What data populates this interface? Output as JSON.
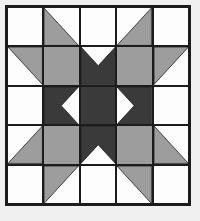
{
  "artwork": {
    "title": "Patchwork Quilt Block",
    "pattern_name": "Eight-Pointed Star Quilt Block",
    "grid_rows": 5,
    "grid_columns": 5,
    "background_color": "#f0f0f0",
    "frame_color": "#1c1c1c",
    "seam_line_color": "#1c1c1c",
    "palette": {
      "light": "#fdfdfd",
      "medium": "#9d9d9d",
      "dark": "#3a3a3a"
    },
    "cells": [
      [
        {
          "name": "r1c1",
          "fill": "light",
          "shape": "solid"
        },
        {
          "name": "r1c2",
          "fill": "medium",
          "shape": "triangle-bottom-left",
          "base": "light"
        },
        {
          "name": "r1c3",
          "fill": "light",
          "shape": "solid"
        },
        {
          "name": "r1c4",
          "fill": "medium",
          "shape": "triangle-bottom-right",
          "base": "light"
        },
        {
          "name": "r1c5",
          "fill": "light",
          "shape": "solid"
        }
      ],
      [
        {
          "name": "r2c1",
          "fill": "medium",
          "shape": "triangle-top-right",
          "base": "light"
        },
        {
          "name": "r2c2",
          "fill": "medium",
          "shape": "solid"
        },
        {
          "name": "r2c3",
          "fill": "dark",
          "shape": "notch-down",
          "base": "light"
        },
        {
          "name": "r2c4",
          "fill": "medium",
          "shape": "solid"
        },
        {
          "name": "r2c5",
          "fill": "medium",
          "shape": "triangle-top-left",
          "base": "light"
        }
      ],
      [
        {
          "name": "r3c1",
          "fill": "light",
          "shape": "solid"
        },
        {
          "name": "r3c2",
          "fill": "dark",
          "shape": "notch-right",
          "base": "light"
        },
        {
          "name": "r3c3",
          "fill": "dark",
          "shape": "solid"
        },
        {
          "name": "r3c4",
          "fill": "dark",
          "shape": "notch-left",
          "base": "light"
        },
        {
          "name": "r3c5",
          "fill": "light",
          "shape": "solid"
        }
      ],
      [
        {
          "name": "r4c1",
          "fill": "medium",
          "shape": "triangle-bottom-right",
          "base": "light"
        },
        {
          "name": "r4c2",
          "fill": "medium",
          "shape": "solid"
        },
        {
          "name": "r4c3",
          "fill": "dark",
          "shape": "notch-up",
          "base": "light"
        },
        {
          "name": "r4c4",
          "fill": "medium",
          "shape": "solid"
        },
        {
          "name": "r4c5",
          "fill": "medium",
          "shape": "triangle-bottom-left",
          "base": "light"
        }
      ],
      [
        {
          "name": "r5c1",
          "fill": "light",
          "shape": "solid"
        },
        {
          "name": "r5c2",
          "fill": "medium",
          "shape": "triangle-top-left",
          "base": "light"
        },
        {
          "name": "r5c3",
          "fill": "light",
          "shape": "solid"
        },
        {
          "name": "r5c4",
          "fill": "medium",
          "shape": "triangle-top-right",
          "base": "light"
        },
        {
          "name": "r5c5",
          "fill": "light",
          "shape": "solid"
        }
      ]
    ]
  }
}
